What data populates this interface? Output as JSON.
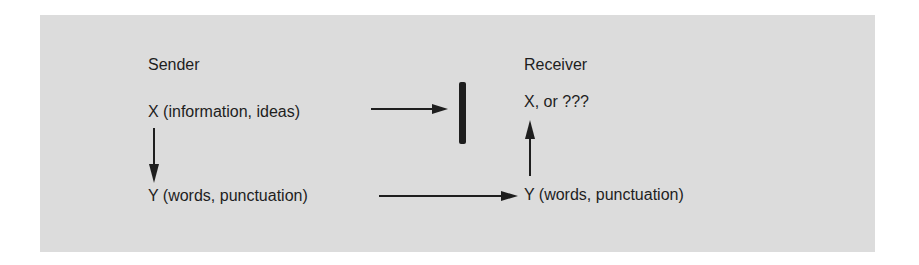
{
  "diagram": {
    "type": "communication-flow",
    "background_color": "#dcdcdc",
    "sender": {
      "heading": "Sender",
      "x_label": "X  (information, ideas)",
      "y_label": "Y  (words, punctuation)"
    },
    "receiver": {
      "heading": "Receiver",
      "x_label": "X, or ???",
      "y_label": "Y (words, punctuation)"
    },
    "edges": [
      {
        "from": "sender.X",
        "to": "barrier",
        "type": "arrow"
      },
      {
        "from": "sender.X",
        "to": "sender.Y",
        "type": "arrow"
      },
      {
        "from": "sender.Y",
        "to": "receiver.Y",
        "type": "arrow"
      },
      {
        "from": "receiver.Y",
        "to": "receiver.X",
        "type": "arrow"
      }
    ],
    "barrier": {
      "shape": "vertical-bar",
      "color": "#1e1e1e"
    }
  }
}
